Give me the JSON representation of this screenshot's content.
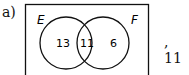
{
  "question": {
    "label": "a)",
    "answer_text": ", 11"
  },
  "venn": {
    "sets": [
      {
        "name": "E",
        "only_count": "13"
      },
      {
        "name": "F",
        "only_count": "6"
      }
    ],
    "intersection": "11"
  }
}
